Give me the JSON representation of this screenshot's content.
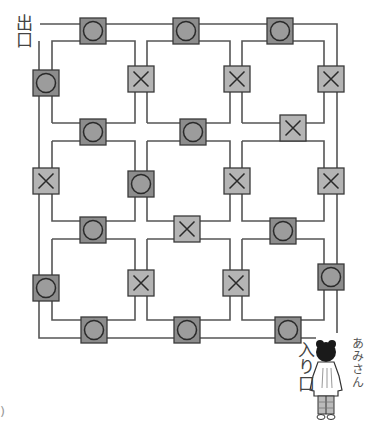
{
  "labels": {
    "exit": "出口",
    "entrance": "入り口",
    "character_name": "あみさん",
    "corner_mark": ")"
  },
  "colors": {
    "line": "#555555",
    "circle_tile": "#8c8c8c",
    "circle_fill": "#9c9c9c",
    "cross_tile": "#b4b4b4",
    "tile_border": "#3a3a3a"
  },
  "maze": {
    "roads_vertical": [
      {
        "outer_x": 39,
        "inner_x": 52
      },
      {
        "left_x": 135,
        "right_x": 147
      },
      {
        "left_x": 230,
        "right_x": 242
      },
      {
        "inner_x": 324,
        "outer_x": 337
      }
    ],
    "roads_horizontal": [
      {
        "outer_y": 24,
        "inner_y": 41
      },
      {
        "top_y": 123,
        "bottom_y": 141
      },
      {
        "top_y": 221,
        "bottom_y": 239
      },
      {
        "inner_y": 320,
        "outer_y": 338
      }
    ],
    "tiles": [
      {
        "symbol": "circle",
        "x": 93,
        "y": 31
      },
      {
        "symbol": "circle",
        "x": 186,
        "y": 31
      },
      {
        "symbol": "circle",
        "x": 280,
        "y": 31
      },
      {
        "symbol": "circle",
        "x": 46,
        "y": 83
      },
      {
        "symbol": "cross",
        "x": 141,
        "y": 79
      },
      {
        "symbol": "cross",
        "x": 237,
        "y": 79
      },
      {
        "symbol": "cross",
        "x": 331,
        "y": 79
      },
      {
        "symbol": "circle",
        "x": 93,
        "y": 132
      },
      {
        "symbol": "circle",
        "x": 193,
        "y": 132
      },
      {
        "symbol": "cross",
        "x": 293,
        "y": 128
      },
      {
        "symbol": "cross",
        "x": 46,
        "y": 181
      },
      {
        "symbol": "circle",
        "x": 141,
        "y": 184
      },
      {
        "symbol": "cross",
        "x": 237,
        "y": 181
      },
      {
        "symbol": "cross",
        "x": 331,
        "y": 181
      },
      {
        "symbol": "circle",
        "x": 93,
        "y": 230
      },
      {
        "symbol": "cross",
        "x": 187,
        "y": 229
      },
      {
        "symbol": "circle",
        "x": 283,
        "y": 231
      },
      {
        "symbol": "circle",
        "x": 46,
        "y": 288
      },
      {
        "symbol": "cross",
        "x": 141,
        "y": 283
      },
      {
        "symbol": "cross",
        "x": 236,
        "y": 283
      },
      {
        "symbol": "circle",
        "x": 331,
        "y": 277
      },
      {
        "symbol": "circle",
        "x": 94,
        "y": 330
      },
      {
        "symbol": "circle",
        "x": 187,
        "y": 330
      },
      {
        "symbol": "circle",
        "x": 288,
        "y": 330
      }
    ]
  }
}
